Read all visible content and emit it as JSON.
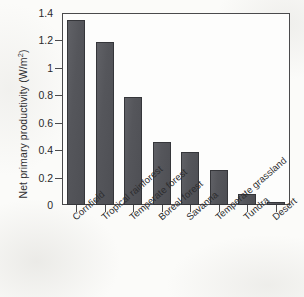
{
  "chart_data": {
    "type": "bar",
    "title": "",
    "subtitle": "",
    "xlabel": "",
    "ylabel": "Net primary productivity (W/m2)",
    "ylabel_main": "Net primary productivity (W/m",
    "ylabel_superscript": "2",
    "ylabel_close": ")",
    "categories": [
      "Cornfield",
      "Tropical rainforest",
      "Temperate forest",
      "Boreal forest",
      "Savanna",
      "Temperate grassland",
      "Tundra",
      "Desert"
    ],
    "values": [
      1.35,
      1.19,
      0.785,
      0.46,
      0.385,
      0.255,
      0.08,
      0.025
    ],
    "ylim": [
      0,
      1.4
    ],
    "yticks": [
      0,
      0.2,
      0.4,
      0.6,
      0.8,
      1,
      1.2,
      1.4
    ],
    "ytick_labels": [
      "0",
      "0.2",
      "0.4",
      "0.6",
      "0.8",
      "1",
      "1.2",
      "1.4"
    ],
    "grid": false,
    "legend": null,
    "bar_color": "#55565b",
    "bar_edge_color": "#35363a",
    "axis_color": "#4a4a4c",
    "plot_background": "#fdfdfc",
    "figure_background": "#fbfbf9",
    "text_color": "#2c2c2e"
  }
}
